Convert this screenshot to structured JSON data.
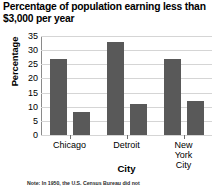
{
  "chart_data": {
    "type": "bar",
    "title": "Percentage of population earning less than $3,000 per year",
    "xlabel": "City",
    "ylabel": "Percentage",
    "categories": [
      "Chicago",
      "Detroit",
      "New York City"
    ],
    "series": [
      {
        "name": "series-1",
        "values": [
          27,
          33,
          27
        ]
      },
      {
        "name": "series-2",
        "values": [
          8,
          11,
          12
        ]
      }
    ],
    "ylim": [
      0,
      35
    ],
    "yticks": [
      0,
      5,
      10,
      15,
      20,
      25,
      30,
      35
    ],
    "ytick_labels": [
      "0",
      "5",
      "10",
      "15",
      "20",
      "25",
      "30",
      "35"
    ],
    "grid": true,
    "legend": "none",
    "bar_color": "#595959",
    "gridline_color": "#d5d5d5",
    "axis_color": "#8a8a8a"
  },
  "footnote": {
    "text": "Note: In 1950, the U.S. Census Bureau did not"
  }
}
